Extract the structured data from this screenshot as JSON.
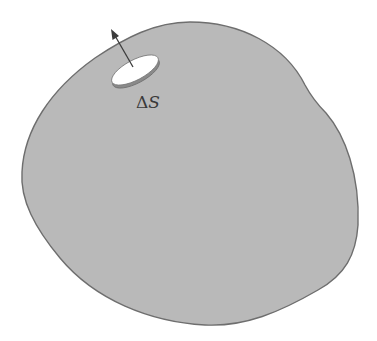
{
  "figure": {
    "colors": {
      "background": "#ffffff",
      "surface_fill": "#b9b9b9",
      "surface_outline": "#6e6e6e",
      "disk_top": "#ffffff",
      "disk_rim": "#8a8a8a",
      "arrow": "#3c3c3c",
      "label": "#3a3a3a"
    },
    "surface_element": {
      "label_symbol": "Δ",
      "label_variable": "S"
    },
    "normal_vector": {
      "name": "outward normal"
    }
  }
}
